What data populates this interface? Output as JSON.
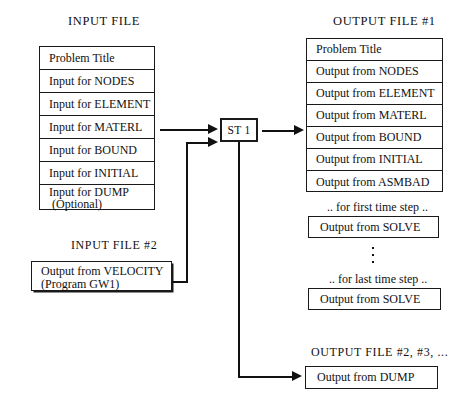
{
  "diagram": {
    "title_input": "INPUT  FILE",
    "title_input2": "INPUT FILE #2",
    "title_output1": "OUTPUT  FILE #1",
    "title_output_rest": "OUTPUT FILE #2, #3, ...",
    "process_label": "ST 1",
    "input_rows": [
      {
        "text": "Problem Title",
        "sub": ""
      },
      {
        "text": "Input for NODES",
        "sub": ""
      },
      {
        "text": "Input for ELEMENT",
        "sub": ""
      },
      {
        "text": "Input for MATERL",
        "sub": ""
      },
      {
        "text": "Input for BOUND",
        "sub": ""
      },
      {
        "text": "Input for INITIAL",
        "sub": ""
      },
      {
        "text": "Input for DUMP",
        "sub": "(Optional)"
      }
    ],
    "input2_box": {
      "text": "Output from VELOCITY",
      "sub": "(Program GW1)"
    },
    "output_rows": [
      {
        "text": "Problem Title"
      },
      {
        "text": "Output from NODES"
      },
      {
        "text": "Output from ELEMENT"
      },
      {
        "text": "Output from MATERL"
      },
      {
        "text": "Output from BOUND"
      },
      {
        "text": "Output from INITIAL"
      },
      {
        "text": "Output from ASMBAD"
      }
    ],
    "note_first_step": ".. for first time step ..",
    "note_last_step": ".. for last time step ..",
    "solve_first": "Output from SOLVE",
    "solve_last": "Output from SOLVE",
    "dump_box": "Output from DUMP"
  },
  "colors": {
    "ink": "#111111",
    "paper": "#ffffff"
  }
}
